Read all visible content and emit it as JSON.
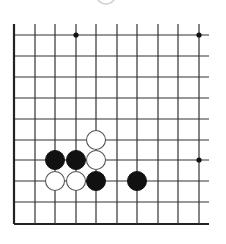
{
  "diagram": {
    "type": "go-board-fragment",
    "colors": {
      "line": "#333333",
      "black_stone": "#111111",
      "white_stone": "#ffffff",
      "white_outline": "#555555"
    },
    "grid": {
      "x_lines": [
        14,
        35,
        55,
        76,
        96,
        117,
        137,
        158,
        178,
        199
      ],
      "y_lines": [
        35,
        56,
        77,
        98,
        119,
        140,
        160,
        181,
        202,
        224
      ],
      "h_line_start_x": 14,
      "h_line_end_x": 209,
      "v_line_start_y": 24,
      "v_line_end_y": 224,
      "edges": [
        "left",
        "bottom"
      ]
    },
    "star_points": [
      {
        "col": 3,
        "row": 0
      },
      {
        "col": 9,
        "row": 0
      },
      {
        "col": 9,
        "row": 6
      }
    ],
    "stones": [
      {
        "color": "white",
        "col": 4,
        "row": 5
      },
      {
        "color": "black",
        "col": 2,
        "row": 6
      },
      {
        "color": "black",
        "col": 3,
        "row": 6
      },
      {
        "color": "white",
        "col": 4,
        "row": 6
      },
      {
        "color": "white",
        "col": 2,
        "row": 7
      },
      {
        "color": "white",
        "col": 3,
        "row": 7
      },
      {
        "color": "black",
        "col": 4,
        "row": 7
      },
      {
        "color": "black",
        "col": 6,
        "row": 7
      }
    ],
    "stone_radius": 9.5,
    "cropped_previous_stone": {
      "cx": 106,
      "cy": -6,
      "r": 10
    }
  }
}
